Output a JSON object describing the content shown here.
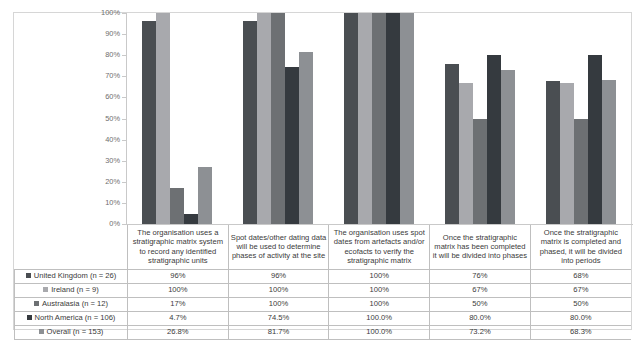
{
  "chart_data": {
    "type": "bar",
    "title": "",
    "xlabel": "",
    "ylabel": "",
    "ylim": [
      0,
      100
    ],
    "grid": false,
    "legend_position": "data-table-left",
    "ytick_labels": [
      "100%",
      "90%",
      "80%",
      "70%",
      "60%",
      "50%",
      "40%",
      "30%",
      "20%",
      "10%",
      "0%"
    ],
    "categories": [
      "The organisation uses a stratigraphic matrix system to record any identified stratigraphic units",
      "Spot dates/other dating data will be used to determine phases of activity at the site",
      "The organisation uses spot dates from artefacts and/or ecofacts to verify the stratigraphic matrix",
      "Once the stratigraphic matrix has been completed it will be divided into phases",
      "Once the stratigraphic matrix is completed and phased, it will be divided into periods"
    ],
    "series": [
      {
        "name": "United Kingdom (n = 26)",
        "color": "#4a4e52",
        "values": [
          96,
          96,
          100,
          76,
          68
        ],
        "labels": [
          "96%",
          "96%",
          "100%",
          "76%",
          "68%"
        ]
      },
      {
        "name": "Ireland (n = 9)",
        "color": "#a8a9ad",
        "values": [
          100,
          100,
          100,
          67,
          67
        ],
        "labels": [
          "100%",
          "100%",
          "100%",
          "67%",
          "67%"
        ]
      },
      {
        "name": "Australasia (n = 12)",
        "color": "#6d7073",
        "values": [
          17,
          100,
          100,
          50,
          50
        ],
        "labels": [
          "17%",
          "100%",
          "100%",
          "50%",
          "50%"
        ]
      },
      {
        "name": "North America (n = 106)",
        "color": "#353a3f",
        "values": [
          4.7,
          74.5,
          100.0,
          80.0,
          80.0
        ],
        "labels": [
          "4.7%",
          "74.5%",
          "100.0%",
          "80.0%",
          "80.0%"
        ]
      },
      {
        "name": "Overall (n = 153)",
        "color": "#8d9094",
        "values": [
          26.8,
          81.7,
          100.0,
          73.2,
          68.3
        ],
        "labels": [
          "26.8%",
          "81.7%",
          "100.0%",
          "73.2%",
          "68.3%"
        ]
      }
    ]
  },
  "table": {
    "corner_label": "",
    "headers": [
      "The organisation uses a stratigraphic matrix system to record any identified stratigraphic units",
      "Spot dates/other dating data will be used to determine phases of activity at the site",
      "The organisation uses spot dates from artefacts and/or ecofacts to verify the stratigraphic matrix",
      "Once the stratigraphic matrix has been completed it will be divided into phases",
      "Once the stratigraphic matrix is completed and phased, it will be divided into periods"
    ],
    "rows": [
      {
        "label": "United Kingdom (n = 26)",
        "color": "#4a4e52",
        "cells": [
          "96%",
          "96%",
          "100%",
          "76%",
          "68%"
        ]
      },
      {
        "label": "Ireland (n = 9)",
        "color": "#a8a9ad",
        "cells": [
          "100%",
          "100%",
          "100%",
          "67%",
          "67%"
        ]
      },
      {
        "label": "Australasia (n = 12)",
        "color": "#6d7073",
        "cells": [
          "17%",
          "100%",
          "100%",
          "50%",
          "50%"
        ]
      },
      {
        "label": "North America (n = 106)",
        "color": "#353a3f",
        "cells": [
          "4.7%",
          "74.5%",
          "100.0%",
          "80.0%",
          "80.0%"
        ]
      },
      {
        "label": "Overall (n = 153)",
        "color": "#8d9094",
        "cells": [
          "26.8%",
          "81.7%",
          "100.0%",
          "73.2%",
          "68.3%"
        ]
      }
    ]
  }
}
